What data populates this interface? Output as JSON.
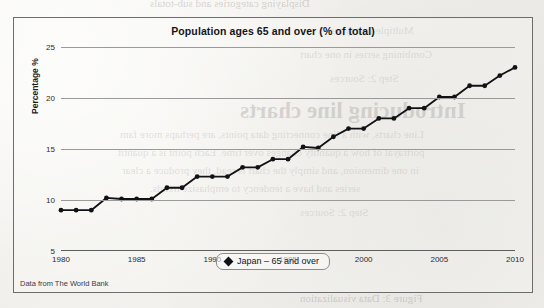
{
  "page": {
    "background_color": "#f2f1ee",
    "bleed_through_text": [
      "Displaying categories and sub-totals",
      "Multiple unit types",
      "Combining series in one chart",
      "Introducing line charts",
      "Line charts, with a line connecting data points, are perhaps more fam",
      "portrayal of how a quantity changes over time. Each point is a quantit",
      "in one dimension, and simply the chart is read, they produce a clear",
      "series and have a tendency to emphasize trends.",
      "Step 2: Sources",
      "Figure 3: Data visualization"
    ]
  },
  "chart_panel": {
    "title": "Population ages 65 and over (% of total)",
    "source_note": "Data from The World Bank",
    "border_color": "#6d6d6d",
    "legend": {
      "position": "bottom-center",
      "entries": [
        {
          "label": "Japan – 65 and over",
          "marker": "diamond",
          "color": "#111216"
        }
      ]
    }
  },
  "chart_data": {
    "type": "line",
    "title": "Population ages 65 and over (% of total)",
    "xlabel": "",
    "ylabel": "Percentage %",
    "xlim": [
      1980,
      2010
    ],
    "ylim": [
      5,
      25
    ],
    "xticks": [
      1980,
      1985,
      1990,
      1995,
      2000,
      2005,
      2010
    ],
    "yticks": [
      5,
      10,
      15,
      20,
      25
    ],
    "grid": true,
    "marker": "circle",
    "line_color": "#111216",
    "x": [
      1980,
      1981,
      1982,
      1983,
      1984,
      1985,
      1986,
      1987,
      1988,
      1989,
      1990,
      1991,
      1992,
      1993,
      1994,
      1995,
      1996,
      1997,
      1998,
      1999,
      2000,
      2001,
      2002,
      2003,
      2004,
      2005,
      2006,
      2007,
      2008,
      2009,
      2010
    ],
    "series": [
      {
        "name": "Japan – 65 and over",
        "values": [
          9.0,
          9.0,
          9.0,
          10.2,
          10.1,
          10.1,
          10.1,
          11.2,
          11.2,
          12.3,
          12.3,
          12.3,
          13.2,
          13.2,
          14.0,
          14.0,
          15.2,
          15.1,
          16.2,
          17.0,
          17.0,
          18.0,
          18.0,
          19.0,
          19.0,
          20.1,
          20.1,
          21.2,
          21.2,
          22.2,
          23.0
        ]
      }
    ]
  }
}
